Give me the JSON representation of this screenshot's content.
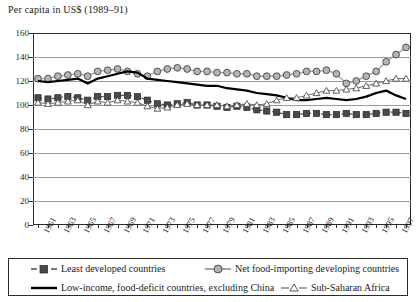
{
  "chart_data": {
    "type": "line",
    "title": "Per capita in US$ (1989–91)",
    "xlabel": "",
    "ylabel": "",
    "ylim": [
      0,
      160
    ],
    "ytick_step": 20,
    "yticks": [
      "160",
      "140",
      "120",
      "100",
      "80",
      "60",
      "40",
      "20",
      "0"
    ],
    "grid": true,
    "legend_position": "below",
    "x": [
      1961,
      1962,
      1963,
      1964,
      1965,
      1966,
      1967,
      1968,
      1969,
      1970,
      1971,
      1972,
      1973,
      1974,
      1975,
      1976,
      1977,
      1978,
      1979,
      1980,
      1981,
      1982,
      1983,
      1984,
      1985,
      1986,
      1987,
      1988,
      1989,
      1990,
      1991,
      1992,
      1993,
      1994,
      1995,
      1996,
      1997,
      1998
    ],
    "xtick_labels": [
      "1961",
      "1963",
      "1965",
      "1967",
      "1969",
      "1971",
      "1973",
      "1975",
      "1977",
      "1979",
      "1981",
      "1983",
      "1985",
      "1987",
      "1989",
      "1991",
      "1993",
      "1995",
      "1997"
    ],
    "series": [
      {
        "name": "Least developed countries",
        "marker": "filled-square",
        "line_style": "dashed",
        "color": "#5a5a5a",
        "values": [
          106,
          105,
          106,
          107,
          106,
          104,
          107,
          107,
          108,
          108,
          107,
          104,
          101,
          100,
          101,
          102,
          100,
          100,
          99,
          98,
          99,
          98,
          96,
          95,
          94,
          92,
          92,
          93,
          93,
          92,
          92,
          93,
          92,
          92,
          93,
          94,
          94,
          93
        ]
      },
      {
        "name": "Net food-importing developing countries",
        "marker": "circle",
        "line_style": "solid",
        "color": "#a8a8a8",
        "values": [
          122,
          122,
          124,
          125,
          126,
          124,
          128,
          129,
          130,
          128,
          126,
          124,
          128,
          130,
          131,
          130,
          128,
          128,
          127,
          127,
          126,
          126,
          124,
          124,
          124,
          125,
          126,
          128,
          128,
          129,
          126,
          118,
          120,
          124,
          128,
          136,
          142,
          148
        ]
      },
      {
        "name": "Low-income, food-deficit countries, excluding China",
        "marker": "none",
        "line_style": "solid-thick",
        "color": "#000000",
        "values": [
          120,
          119,
          120,
          121,
          122,
          118,
          122,
          124,
          126,
          128,
          127,
          122,
          121,
          120,
          119,
          118,
          117,
          116,
          116,
          114,
          113,
          112,
          110,
          109,
          108,
          106,
          104,
          104,
          105,
          106,
          105,
          104,
          105,
          107,
          110,
          112,
          108,
          105
        ]
      },
      {
        "name": "Sub-Saharan Africa",
        "marker": "open-triangle",
        "line_style": "thin",
        "color": "#6b6b6b",
        "values": [
          102,
          101,
          102,
          103,
          104,
          100,
          103,
          102,
          104,
          103,
          102,
          99,
          97,
          98,
          100,
          101,
          100,
          100,
          100,
          99,
          100,
          101,
          100,
          101,
          104,
          106,
          106,
          108,
          110,
          112,
          112,
          113,
          114,
          116,
          118,
          120,
          122,
          122
        ]
      }
    ]
  },
  "legend": {
    "entries": [
      {
        "label": "Least developed countries"
      },
      {
        "label": "Net food-importing developing countries"
      },
      {
        "label": "Low-income, food-deficit countries, excluding China"
      },
      {
        "label": "Sub-Saharan Africa"
      }
    ]
  }
}
